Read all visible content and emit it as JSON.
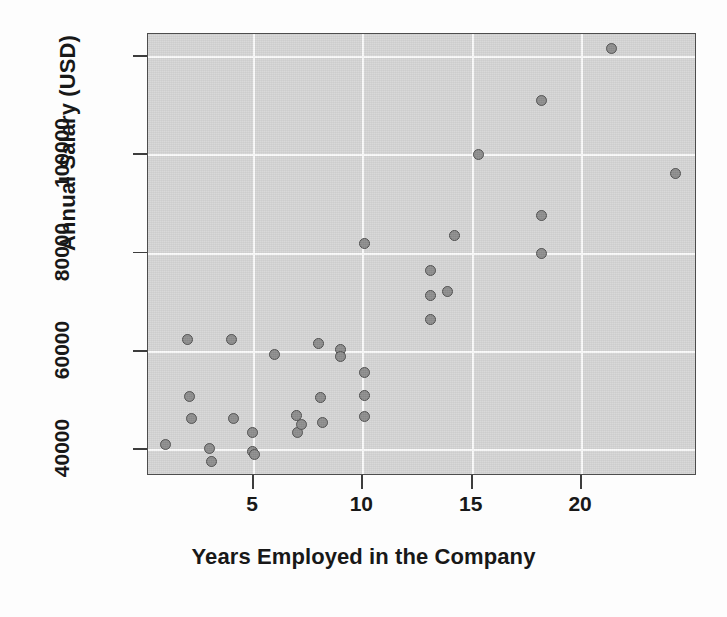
{
  "chart_data": {
    "type": "scatter",
    "title": "",
    "xlabel": "Years Employed in the Company",
    "ylabel": "Annual Salary (USD)",
    "xlim": [
      0.2,
      25.3
    ],
    "ylim": [
      34500,
      124500
    ],
    "xticks": [
      5,
      10,
      15,
      20
    ],
    "xtick_labels": [
      "5",
      "10",
      "15",
      "20"
    ],
    "yticks": [
      40000,
      60000,
      80000,
      100000,
      120000
    ],
    "ytick_labels": [
      "40000",
      "60000",
      "80000",
      "100000",
      ""
    ],
    "grid": true,
    "grid_color": "#fbfbfb",
    "panel_color": "#d6d6d6",
    "marker_fill": "#8e8e8e",
    "marker_edge": "#4f4f4f",
    "marker_size": 11,
    "n_points": 37,
    "points": [
      {
        "x": 1.0,
        "y": 41000
      },
      {
        "x": 2.0,
        "y": 62300
      },
      {
        "x": 2.1,
        "y": 50600
      },
      {
        "x": 2.2,
        "y": 46200
      },
      {
        "x": 3.0,
        "y": 40000
      },
      {
        "x": 3.1,
        "y": 37500
      },
      {
        "x": 4.0,
        "y": 62300
      },
      {
        "x": 4.1,
        "y": 46200
      },
      {
        "x": 5.0,
        "y": 43300
      },
      {
        "x": 5.0,
        "y": 39400
      },
      {
        "x": 5.05,
        "y": 38900
      },
      {
        "x": 6.0,
        "y": 59300
      },
      {
        "x": 7.0,
        "y": 46800
      },
      {
        "x": 7.05,
        "y": 43400
      },
      {
        "x": 7.2,
        "y": 44900
      },
      {
        "x": 8.0,
        "y": 61500
      },
      {
        "x": 8.1,
        "y": 50400
      },
      {
        "x": 8.2,
        "y": 45400
      },
      {
        "x": 9.0,
        "y": 60300
      },
      {
        "x": 9.0,
        "y": 58800
      },
      {
        "x": 10.1,
        "y": 81900
      },
      {
        "x": 10.1,
        "y": 55500
      },
      {
        "x": 10.1,
        "y": 50800
      },
      {
        "x": 10.1,
        "y": 46700
      },
      {
        "x": 13.1,
        "y": 76400
      },
      {
        "x": 13.1,
        "y": 71300
      },
      {
        "x": 13.1,
        "y": 66400
      },
      {
        "x": 13.9,
        "y": 72100
      },
      {
        "x": 14.2,
        "y": 83400
      },
      {
        "x": 15.3,
        "y": 100000
      },
      {
        "x": 18.2,
        "y": 111000
      },
      {
        "x": 18.2,
        "y": 87600
      },
      {
        "x": 18.2,
        "y": 79800
      },
      {
        "x": 21.4,
        "y": 121500
      },
      {
        "x": 24.3,
        "y": 96000
      }
    ]
  },
  "axis": {
    "y_title": "Annual Salary (USD)",
    "x_title": "Years Employed in the Company"
  }
}
